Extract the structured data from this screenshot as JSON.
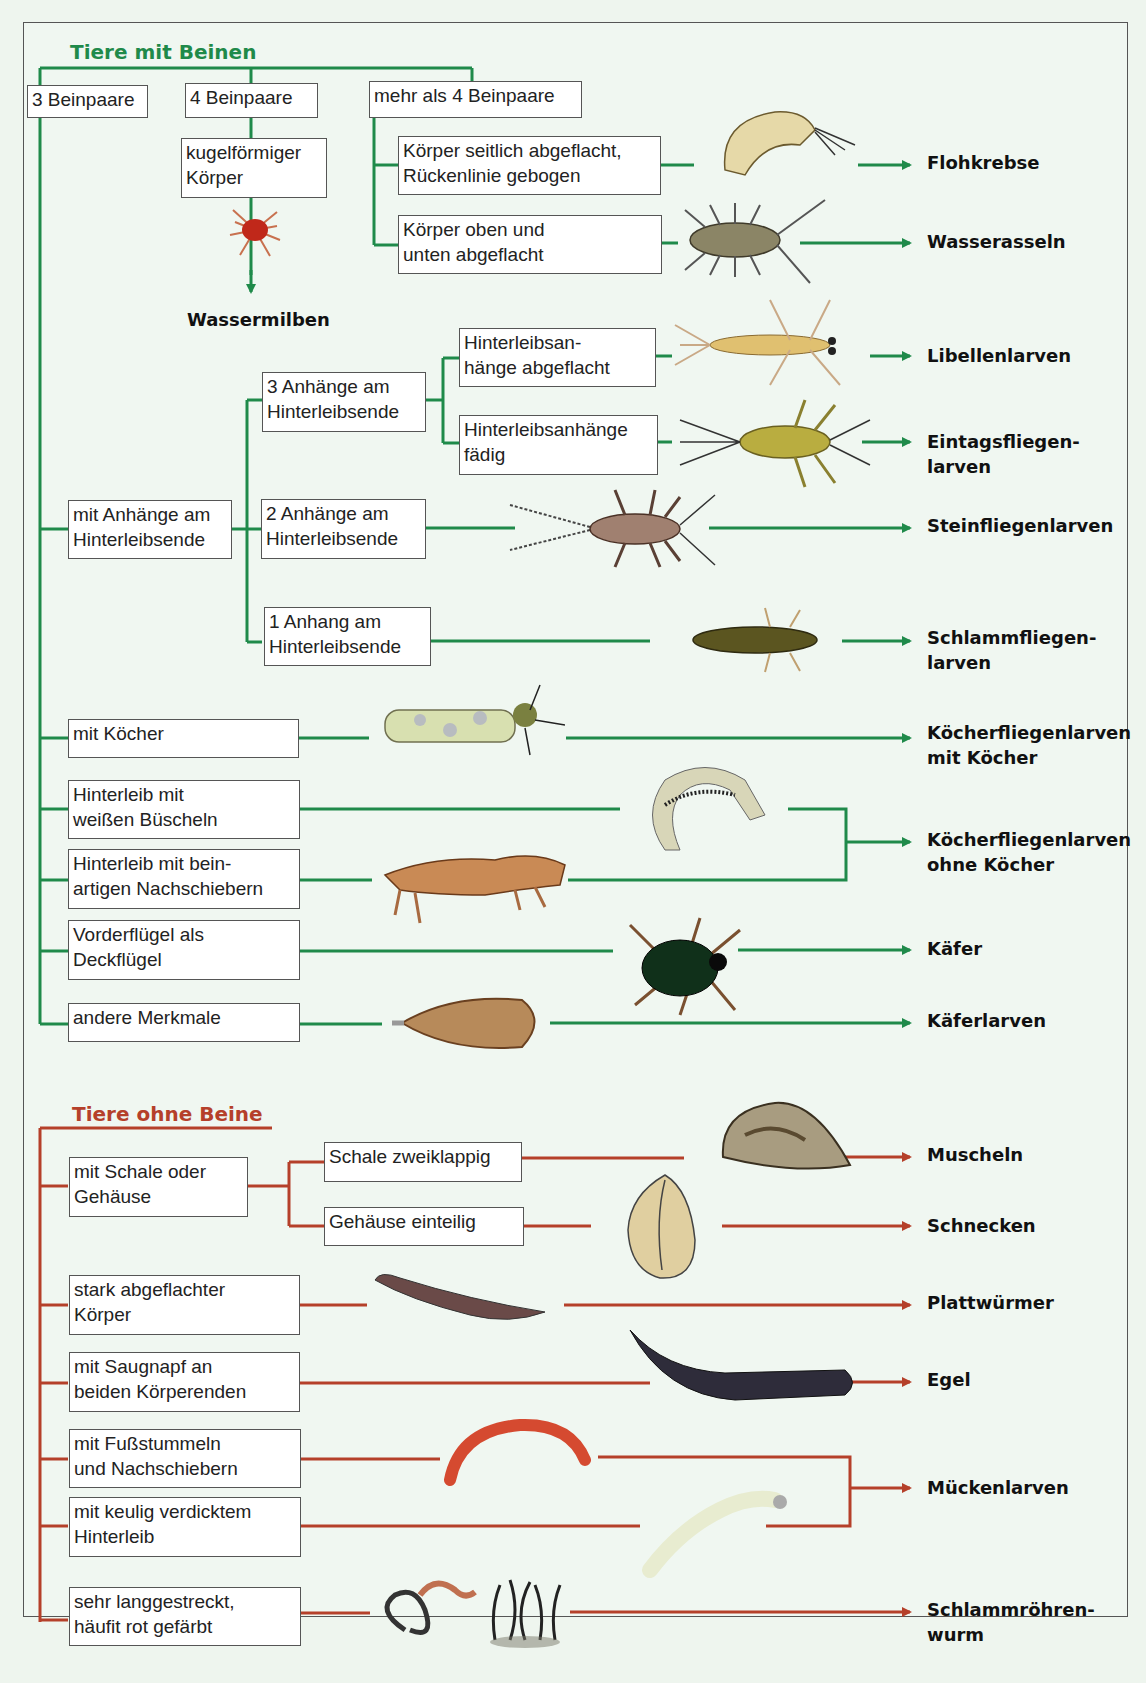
{
  "colors": {
    "legged": "#1f8a4a",
    "legless": "#b5402a",
    "background": "#eef5ee"
  },
  "legged": {
    "heading": "Tiere mit Beinen",
    "boxes": {
      "b3": "3 Beinpaare",
      "b4": "4 Beinpaare",
      "bmore": "mehr als 4 Beinpaare",
      "kugel": "kugelförmiger\nKörper",
      "seitlich": "Körper seitlich abgeflacht,\nRückenlinie gebogen",
      "oben": "Körper oben und\nunten abgeflacht",
      "anhaenge": "mit Anhänge am\nHinterleibsende",
      "a3": "3 Anhänge am\nHinterleibsende",
      "a2": "2 Anhänge am\nHinterleibsende",
      "a1": "1 Anhang am\nHinterleibsende",
      "abgeflacht": "Hinterleibsan-\nhänge abgeflacht",
      "faedig": "Hinterleibsanhänge\nfädig",
      "koecher": "mit Köcher",
      "bueschel": "Hinterleib mit\nweißen Büscheln",
      "nachschieber": "Hinterleib mit bein-\nartigen Nachschiebern",
      "deckfluegel": "Vorderflügel als\nDeckflügel",
      "andere": "andere Merkmale"
    },
    "results": {
      "wassermilben": "Wassermilben",
      "flohkrebse": "Flohkrebse",
      "wasserasseln": "Wasserasseln",
      "libellen": "Libellenlarven",
      "eintags": "Eintagsfliegen-\nlarven",
      "stein": "Steinfliegenlarven",
      "schlamm": "Schlammfliegen-\nlarven",
      "koecher_mit": "Köcherfliegenlarven\nmit Köcher",
      "koecher_ohne": "Köcherfliegenlarven\nohne Köcher",
      "kaefer": "Käfer",
      "kaeferlarven": "Käferlarven"
    }
  },
  "legless": {
    "heading": "Tiere ohne Beine",
    "boxes": {
      "schale": "mit Schale oder\nGehäuse",
      "zweiklappig": "Schale zweiklappig",
      "einteilig": "Gehäuse einteilig",
      "flach": "stark abgeflachter\nKörper",
      "saugnapf": "mit Saugnapf an\nbeiden Körperenden",
      "fuss": "mit Fußstummeln\nund Nachschiebern",
      "keulig": "mit keulig verdicktem\nHinterleib",
      "lang": "sehr langgestreckt,\nhäufit rot gefärbt"
    },
    "results": {
      "muscheln": "Muscheln",
      "schnecken": "Schnecken",
      "platt": "Plattwürmer",
      "egel": "Egel",
      "muecken": "Mückenlarven",
      "schlammroehren": "Schlammröhren-\nwurm"
    }
  }
}
